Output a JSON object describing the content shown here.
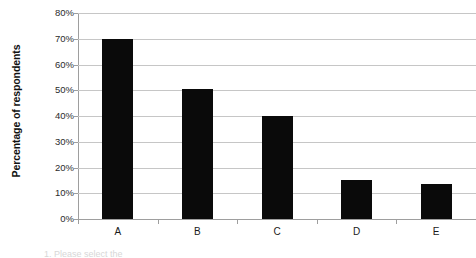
{
  "chart_data": {
    "type": "bar",
    "title": "",
    "subtitle": "",
    "xlabel": "",
    "ylabel": "Percentage of respondents",
    "categories": [
      "A",
      "B",
      "C",
      "D",
      "E"
    ],
    "values": [
      70,
      50.5,
      40,
      15,
      13.5
    ],
    "series": [
      {
        "name": "Percentage of respondents",
        "values": [
          70,
          50.5,
          40,
          15,
          13.5
        ]
      }
    ],
    "ylim": [
      0,
      80
    ],
    "ytick_values": [
      0,
      10,
      20,
      30,
      40,
      50,
      60,
      70,
      80
    ],
    "ytick_labels": [
      "0%",
      "10%",
      "20%",
      "30%",
      "40%",
      "50%",
      "60%",
      "70%",
      "80%"
    ],
    "grid": true,
    "grid_axis": "y",
    "legend": false,
    "legend_position": "none",
    "bar_color": "#0a0a0a",
    "gridline_color": "#c6c6c6",
    "axis_color": "#9e9e9e",
    "background_color": "#ffffff",
    "annotations": []
  },
  "caption": {
    "clipped_text": "1. Please select the"
  }
}
